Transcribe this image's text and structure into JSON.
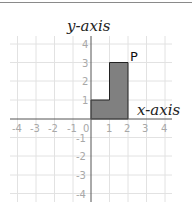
{
  "diagram": {
    "y_axis_label": "y-axis",
    "x_axis_label": "x-axis",
    "shape_label": "P",
    "x_ticks": [
      "-4",
      "-3",
      "-2",
      "-1",
      "0",
      "1",
      "2",
      "3",
      "4"
    ],
    "y_ticks": [
      "4",
      "3",
      "2",
      "1",
      "-1",
      "-2",
      "-3",
      "-4"
    ],
    "shape_vertices": [
      [
        0,
        0
      ],
      [
        2,
        0
      ],
      [
        2,
        3
      ],
      [
        1,
        3
      ],
      [
        1,
        1
      ],
      [
        0,
        1
      ]
    ],
    "colors": {
      "shape_fill": "#808080",
      "shape_stroke": "#222222",
      "grid": "#e2e2e2",
      "axis": "#555555",
      "tick_text": "#a8a8a8"
    }
  }
}
